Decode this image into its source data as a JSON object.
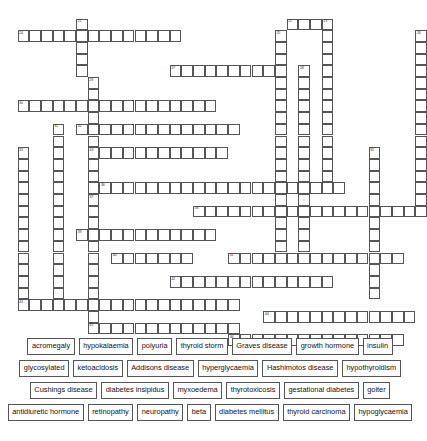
{
  "puzzle": {
    "type": "crossword",
    "title": "Endocrine crossword",
    "cell_size": 11.7,
    "entries": [
      {
        "number": "21",
        "direction": "down",
        "col": 6,
        "row": 1,
        "length": 5
      },
      {
        "number": "22",
        "direction": "across",
        "col": 24,
        "row": 1,
        "length": 4
      },
      {
        "number": "23",
        "direction": "down",
        "col": 27,
        "row": 1,
        "length": 15
      },
      {
        "number": "24",
        "direction": "across",
        "col": 1,
        "row": 2,
        "length": 14
      },
      {
        "number": "25",
        "direction": "down",
        "col": 23,
        "row": 2,
        "length": 20
      },
      {
        "number": "26",
        "direction": "down",
        "col": 35,
        "row": 2,
        "length": 16
      },
      {
        "number": "27",
        "direction": "across",
        "col": 14,
        "row": 5,
        "length": 10
      },
      {
        "number": "28",
        "direction": "down",
        "col": 25,
        "row": 5,
        "length": 16
      },
      {
        "number": "29",
        "direction": "down",
        "col": 7,
        "row": 6,
        "length": 18
      },
      {
        "number": "30",
        "direction": "across",
        "col": 1,
        "row": 8,
        "length": 17
      },
      {
        "number": "31",
        "direction": "down",
        "col": 4,
        "row": 10,
        "length": 16
      },
      {
        "number": "32",
        "direction": "across",
        "col": 6,
        "row": 10,
        "length": 14
      },
      {
        "number": "33",
        "direction": "down",
        "col": 1,
        "row": 12,
        "length": 13
      },
      {
        "number": "34",
        "direction": "across",
        "col": 7,
        "row": 12,
        "length": 12
      },
      {
        "number": "35",
        "direction": "down",
        "col": 31,
        "row": 12,
        "length": 13
      },
      {
        "number": "36",
        "direction": "across",
        "col": 8,
        "row": 15,
        "length": 21
      },
      {
        "number": "37",
        "direction": "down",
        "col": 7,
        "row": 16,
        "length": 11
      },
      {
        "number": "38",
        "direction": "across",
        "col": 16,
        "row": 17,
        "length": 20
      },
      {
        "number": "39",
        "direction": "across",
        "col": 6,
        "row": 19,
        "length": 12
      },
      {
        "number": "40",
        "direction": "across",
        "col": 9,
        "row": 21,
        "length": 7
      },
      {
        "number": "41",
        "direction": "across",
        "col": 19,
        "row": 21,
        "length": 15
      },
      {
        "number": "42",
        "direction": "across",
        "col": 14,
        "row": 23,
        "length": 14
      },
      {
        "number": "43",
        "direction": "across",
        "col": 1,
        "row": 25,
        "length": 19
      },
      {
        "number": "44",
        "direction": "across",
        "col": 22,
        "row": 26,
        "length": 13
      },
      {
        "number": "45",
        "direction": "across",
        "col": 7,
        "row": 27,
        "length": 13
      },
      {
        "number": "46",
        "direction": "across",
        "col": 19,
        "row": 28,
        "length": 15
      }
    ]
  },
  "word_bank": {
    "rows": [
      [
        "acromegaly",
        "hypokalaemia",
        "polyuria",
        "thyroid storm",
        "Graves disease",
        "growth hormone",
        "insulin"
      ],
      [
        "glycosylated",
        "ketoacidosis",
        "Addisons disease",
        "hyperglycaemia",
        "Hashimotos disease",
        "hypothyroidism"
      ],
      [
        "Cushings disease",
        "diabetes insipidus",
        "myxoedema",
        "thyrotoxicosis",
        "gestational diabetes",
        "goiter"
      ],
      [
        "antidiuretic hormone",
        "retinopathy",
        "neuropathy",
        "beta",
        "diabetes mellitus",
        "thyroid carcinoma",
        "hypoglycaemia"
      ]
    ]
  },
  "colors": {
    "cell_border": "#555555",
    "cell_fill": "#ffffff",
    "page_background": "#ffffff",
    "number_text": "#333333"
  }
}
